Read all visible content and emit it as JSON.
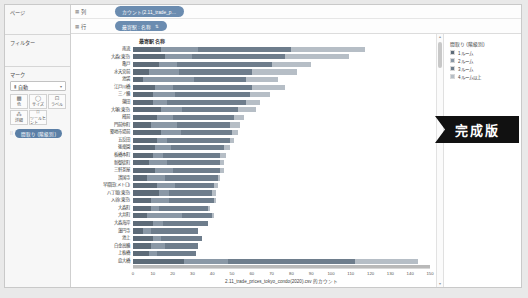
{
  "sidebar": {
    "pages": {
      "title": "ページ"
    },
    "filters": {
      "title": "フィルター"
    },
    "marks": {
      "title": "マーク",
      "dropdown_icon": "bar-mark-icon",
      "dropdown_value": "自動",
      "dropdown_caret": "▾",
      "buttons": [
        {
          "name": "color-button",
          "glyph": "▩",
          "label": "色"
        },
        {
          "name": "size-button",
          "glyph": "◯",
          "label": "サイズ"
        },
        {
          "name": "label-button",
          "glyph": "⊡",
          "label": "ラベル"
        },
        {
          "name": "detail-button",
          "glyph": "⁂",
          "label": "詳細"
        },
        {
          "name": "tooltip-button",
          "glyph": "⌑",
          "label": "ツールヒント"
        }
      ],
      "pill": {
        "grip": "⁞⁞",
        "label": "間取り (階級別)"
      }
    }
  },
  "shelves": [
    {
      "name": "columns-shelf",
      "icon": "grid-icon",
      "label": "列",
      "pill": {
        "label": "カウント(2.11_trade_p…",
        "sort_icon": ""
      }
    },
    {
      "name": "rows-shelf",
      "icon": "grid-icon",
      "label": "行",
      "pill": {
        "label": "最寄駅 : 名称",
        "sort_icon": "⇅"
      }
    }
  ],
  "chart_header": "最寄駅 名称",
  "legend": {
    "title": "間取り (階級別)",
    "items": [
      {
        "label": "1ルーム",
        "color": "#5d6b78"
      },
      {
        "label": "2ルーム",
        "color": "#8a98a6"
      },
      {
        "label": "3ルーム",
        "color": "#6e7d8c"
      },
      {
        "label": "4ルーム以上",
        "color": "#b6bec6"
      }
    ]
  },
  "badge": {
    "label": "完成版"
  },
  "scroll": {
    "up_arrow": "▴",
    "down_arrow": "▾"
  },
  "chart_data": {
    "type": "bar",
    "orientation": "horizontal",
    "stacked": true,
    "title": "最寄駅 名称",
    "xlabel": "2.11_trade_prices_tokyo_condo(2020).csv 的カウント",
    "ylabel": "最寄駅 名称",
    "xlim": [
      0,
      150
    ],
    "xticks": [
      0,
      10,
      20,
      30,
      40,
      50,
      60,
      70,
      80,
      90,
      100,
      110,
      120,
      130,
      140,
      150
    ],
    "grid": false,
    "legend_position": "right",
    "series": [
      {
        "name": "1ルーム",
        "color": "#5d6b78"
      },
      {
        "name": "2ルーム",
        "color": "#8a98a6"
      },
      {
        "name": "3ルーム",
        "color": "#6e7d8c"
      },
      {
        "name": "4ルーム以上",
        "color": "#b6bec6"
      }
    ],
    "categories": [
      "南流",
      "大森(東京)",
      "亀戸",
      "水天宮前",
      "池袋",
      "江戸川橋",
      "三ノ輪",
      "蒲田",
      "大塚(東京)",
      "蔵前",
      "門前仲町",
      "築地市場前",
      "五反田",
      "後楽園",
      "板橋本町",
      "新御徒町",
      "三軒茶屋",
      "護国寺",
      "早稲田(メトロ)",
      "八丁堀(東京)",
      "入谷(東京)",
      "大森町",
      "大井町",
      "大森海岸",
      "蓮円寺",
      "池上",
      "白金高輪",
      "上板橋",
      "扇大橋"
    ],
    "values": [
      [
        14,
        19,
        47,
        37
      ],
      [
        16,
        14,
        47,
        32
      ],
      [
        13,
        9,
        48,
        20
      ],
      [
        8,
        15,
        37,
        23
      ],
      [
        5,
        26,
        26,
        16
      ],
      [
        11,
        9,
        40,
        17
      ],
      [
        10,
        11,
        38,
        10
      ],
      [
        10,
        7,
        40,
        7
      ],
      [
        14,
        11,
        28,
        9
      ],
      [
        12,
        8,
        31,
        5
      ],
      [
        9,
        13,
        27,
        5
      ],
      [
        14,
        10,
        26,
        3
      ],
      [
        12,
        5,
        32,
        2
      ],
      [
        11,
        8,
        27,
        3
      ],
      [
        10,
        5,
        29,
        3
      ],
      [
        8,
        9,
        27,
        2
      ],
      [
        11,
        9,
        24,
        2
      ],
      [
        7,
        9,
        27,
        1
      ],
      [
        12,
        9,
        20,
        2
      ],
      [
        13,
        5,
        22,
        2
      ],
      [
        9,
        9,
        23,
        1
      ],
      [
        9,
        4,
        25,
        1
      ],
      [
        7,
        18,
        15,
        1
      ],
      [
        10,
        5,
        23,
        0
      ],
      [
        5,
        4,
        24,
        0
      ],
      [
        10,
        4,
        21,
        0
      ],
      [
        9,
        7,
        17,
        0
      ],
      [
        8,
        4,
        20,
        0
      ],
      [
        26,
        22,
        64,
        32
      ]
    ]
  }
}
